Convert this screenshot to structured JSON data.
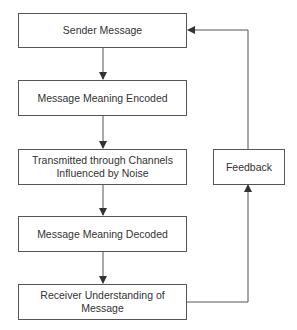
{
  "diagram": {
    "type": "flowchart",
    "title": "",
    "nodes": [
      {
        "id": "sender",
        "label": "Sender Message"
      },
      {
        "id": "encoded",
        "label": "Message Meaning Encoded"
      },
      {
        "id": "transmitted",
        "label": "Transmitted through Channels Influenced by Noise"
      },
      {
        "id": "decoded",
        "label": "Message Meaning Decoded"
      },
      {
        "id": "receiver",
        "label": "Receiver Understanding of Message"
      },
      {
        "id": "feedback",
        "label": "Feedback"
      }
    ],
    "edges": [
      {
        "from": "sender",
        "to": "encoded"
      },
      {
        "from": "encoded",
        "to": "transmitted"
      },
      {
        "from": "transmitted",
        "to": "decoded"
      },
      {
        "from": "decoded",
        "to": "receiver"
      },
      {
        "from": "receiver",
        "to": "feedback"
      },
      {
        "from": "feedback",
        "to": "sender"
      }
    ],
    "colors": {
      "line": "#555555",
      "text": "#333333",
      "background": "#ffffff"
    }
  }
}
